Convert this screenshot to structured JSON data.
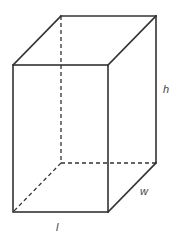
{
  "figure": {
    "type": "rectangular-prism",
    "labels": {
      "height": "h",
      "width": "w",
      "length": "l"
    },
    "colors": {
      "edge": "#333333",
      "label": "#444444",
      "background": "#ffffff"
    }
  }
}
